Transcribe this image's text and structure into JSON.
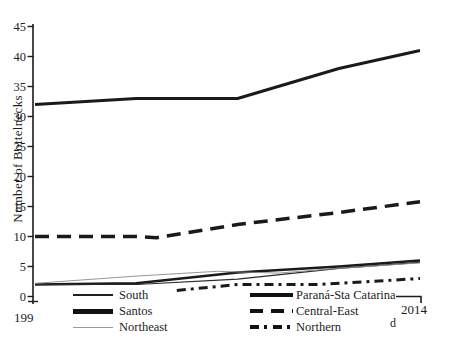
{
  "figure": {
    "y_axis_label": "Number of Bottelnecks",
    "x_left_label": "199",
    "x_right_label": "2014",
    "stray_char": "d"
  },
  "legend": {
    "left": [
      {
        "label": "South"
      },
      {
        "label": "Santos"
      },
      {
        "label": "Northeast"
      }
    ],
    "right": [
      {
        "label": "Paraná-Sta Catarina"
      },
      {
        "label": "Central-East"
      },
      {
        "label": "Northern"
      }
    ]
  },
  "chart_data": {
    "type": "line",
    "title": "",
    "xlabel": "",
    "ylabel": "Number of Bottelnecks",
    "x_range": [
      1995,
      2014
    ],
    "ylim": [
      0,
      45
    ],
    "y_ticks": [
      0,
      5,
      10,
      15,
      20,
      25,
      30,
      35,
      40,
      45
    ],
    "x_tick_labels": [
      "199",
      "2014"
    ],
    "grid": false,
    "legend_position": "bottom",
    "ink_color": "#1c1c1c",
    "series": [
      {
        "name": "Santos",
        "color": "#1a1a1a",
        "width": 3.0,
        "dash": null,
        "points": [
          [
            1995,
            32
          ],
          [
            2000,
            33
          ],
          [
            2005,
            33
          ],
          [
            2010,
            38
          ],
          [
            2014,
            41
          ]
        ]
      },
      {
        "name": "Central-East",
        "color": "#1a1a1a",
        "width": 3.5,
        "dash": "14 8",
        "points": [
          [
            1995,
            10
          ],
          [
            2000,
            10
          ],
          [
            2001,
            9.8
          ],
          [
            2005,
            12
          ],
          [
            2010,
            14
          ],
          [
            2014,
            15.8
          ]
        ]
      },
      {
        "name": "Paraná-Sta Catarina",
        "color": "#1a1a1a",
        "width": 2.6,
        "dash": null,
        "points": [
          [
            1995,
            2
          ],
          [
            2000,
            2.2
          ],
          [
            2005,
            4
          ],
          [
            2010,
            5
          ],
          [
            2014,
            6
          ]
        ]
      },
      {
        "name": "South",
        "color": "#2a2a2a",
        "width": 1.2,
        "dash": null,
        "points": [
          [
            1995,
            2
          ],
          [
            2000,
            2
          ],
          [
            2005,
            2.9
          ],
          [
            2010,
            4.7
          ],
          [
            2014,
            5.7
          ]
        ]
      },
      {
        "name": "Northeast",
        "color": "#8a8a8a",
        "width": 0.9,
        "dash": null,
        "points": [
          [
            1995,
            2.2
          ],
          [
            2000,
            3.4
          ],
          [
            2004,
            4.2
          ],
          [
            2007,
            3.9
          ],
          [
            2010,
            4.7
          ],
          [
            2014,
            5.6
          ]
        ]
      },
      {
        "name": "Northern",
        "color": "#1a1a1a",
        "width": 3.0,
        "dash": "9 5 3 5",
        "points": [
          [
            2002,
            1
          ],
          [
            2005,
            2
          ],
          [
            2009,
            2
          ],
          [
            2014,
            3
          ]
        ]
      }
    ]
  }
}
